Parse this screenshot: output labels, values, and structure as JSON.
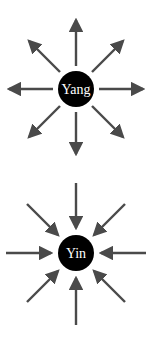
{
  "diagram": {
    "colors": {
      "arrow": "#4a4a4a",
      "node_fill": "#000000",
      "label": "#ffffff",
      "background": "#ffffff"
    },
    "nodes": [
      {
        "id": "yang",
        "label": "Yang",
        "cx": 76,
        "cy": 89,
        "r": 18,
        "arrow_direction": "outward"
      },
      {
        "id": "yin",
        "label": "Yin",
        "cx": 76,
        "cy": 253,
        "r": 18,
        "arrow_direction": "inward"
      }
    ],
    "arrow_count_per_node": 8
  }
}
